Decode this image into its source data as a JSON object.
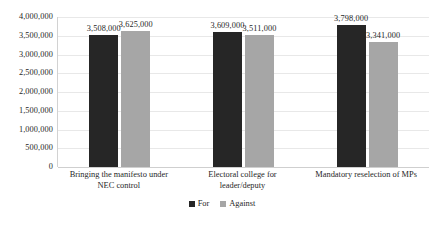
{
  "chart_data": {
    "type": "bar",
    "title": "",
    "subtitle": "",
    "xlabel": "",
    "ylabel": "",
    "grid": true,
    "legend_position": "bottom-center",
    "ylim": [
      0,
      4000000
    ],
    "ytick_labels": [
      "4,000,000",
      "3,500,000",
      "3,000,000",
      "2,500,000",
      "2,000,000",
      "1,500,000",
      "1,000,000",
      "500,000",
      "0"
    ],
    "ytick_values": [
      4000000,
      3500000,
      3000000,
      2500000,
      2000000,
      1500000,
      1000000,
      500000,
      0
    ],
    "categories": [
      "Bringing the manifesto under NEC control",
      "Electoral college for leader/deputy",
      "Mandatory reselection of MPs"
    ],
    "category_lines": [
      [
        "Bringing the manifesto under",
        "NEC control"
      ],
      [
        "Electoral college for",
        "leader/deputy"
      ],
      [
        "Mandatory reselection of MPs"
      ]
    ],
    "series": [
      {
        "name": "For",
        "color": "#262626",
        "values": [
          3508000,
          3609000,
          3798000
        ],
        "labels": [
          "3,508,000",
          "3,609,000",
          "3,798,000"
        ]
      },
      {
        "name": "Against",
        "color": "#a6a6a6",
        "values": [
          3625000,
          3511000,
          3341000
        ],
        "labels": [
          "3,625,000",
          "3,511,000",
          "3,341,000"
        ]
      }
    ]
  },
  "legend": {
    "items": [
      {
        "label": "For",
        "color": "#262626"
      },
      {
        "label": "Against",
        "color": "#a6a6a6"
      }
    ]
  },
  "colors": {
    "series_for": "#262626",
    "series_against": "#a6a6a6",
    "gridline": "#e8e8e8",
    "axis": "#d2d2d2",
    "text": "#1f1f1f",
    "background": "#ffffff"
  }
}
